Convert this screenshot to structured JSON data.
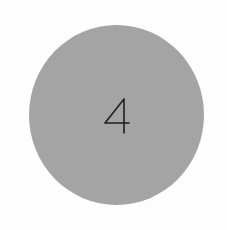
{
  "badge": {
    "number": "4",
    "fill_color": "#a4a4a4",
    "text_color": "#1e1e1e",
    "background_color": "#fdfdfd",
    "shape": "circle"
  }
}
